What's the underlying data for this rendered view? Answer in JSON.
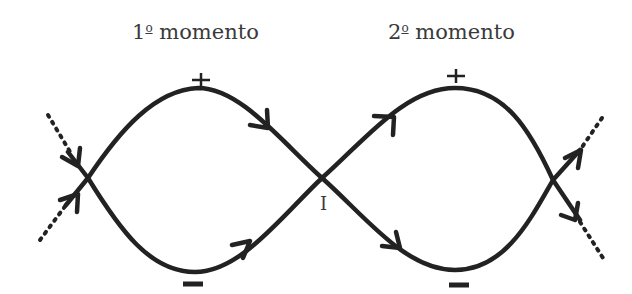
{
  "titles": {
    "first": {
      "num": "1",
      "sup": "o",
      "word": " momento"
    },
    "second": {
      "num": "2",
      "sup": "o",
      "word": " momento"
    }
  },
  "labels": {
    "intersection": "I",
    "plus": "+",
    "minus": "−"
  },
  "colors": {
    "stroke": "#222222",
    "text": "#3a3a3a",
    "background": "#ffffff"
  }
}
